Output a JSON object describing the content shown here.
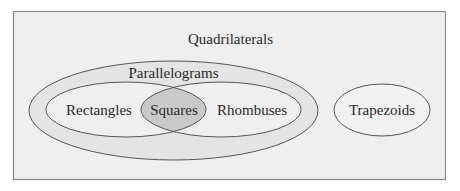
{
  "diagram": {
    "type": "venn",
    "title": "Quadrilaterals",
    "sets": [
      {
        "id": "parallelograms",
        "label": "Parallelograms",
        "parent": "quadrilaterals"
      },
      {
        "id": "rectangles",
        "label": "Rectangles",
        "parent": "parallelograms"
      },
      {
        "id": "rhombuses",
        "label": "Rhombuses",
        "parent": "parallelograms"
      },
      {
        "id": "squares",
        "label": "Squares",
        "intersection_of": [
          "rectangles",
          "rhombuses"
        ]
      },
      {
        "id": "trapezoids",
        "label": "Trapezoids",
        "parent": "quadrilaterals"
      }
    ]
  },
  "colors": {
    "background": "#efefef",
    "border": "#8a8a8a",
    "parallelograms_fill": "#e4e4e4",
    "inner_fill": "#efefef",
    "squares_fill": "#c9c9c9",
    "trapezoids_fill": "#f2f2f2",
    "stroke": "#555555",
    "text": "#2a2a2a"
  }
}
